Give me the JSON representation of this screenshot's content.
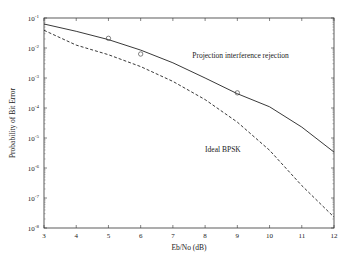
{
  "chart_data": {
    "type": "line",
    "title": "",
    "xlabel": "Eb/No (dB)",
    "ylabel": "Probability of Bit Error",
    "xlim": [
      3,
      12
    ],
    "ylim": [
      1e-08,
      0.1
    ],
    "yscale": "log",
    "grid": false,
    "x_ticks": [
      "3",
      "4",
      "5",
      "6",
      "7",
      "8",
      "9",
      "10",
      "11",
      "12"
    ],
    "y_ticks": [
      {
        "base": "10",
        "exp": "-1"
      },
      {
        "base": "10",
        "exp": "-2"
      },
      {
        "base": "10",
        "exp": "-3"
      },
      {
        "base": "10",
        "exp": "-4"
      },
      {
        "base": "10",
        "exp": "-5"
      },
      {
        "base": "10",
        "exp": "-6"
      },
      {
        "base": "10",
        "exp": "-7"
      },
      {
        "base": "10",
        "exp": "-8"
      }
    ],
    "x": [
      3,
      4,
      5,
      6,
      7,
      8,
      9,
      10,
      11,
      12
    ],
    "series": [
      {
        "name": "Projection interference rejection",
        "style": "solid",
        "values": [
          0.063,
          0.036,
          0.019,
          0.0085,
          0.0032,
          0.001,
          0.0003,
          0.00011,
          2.3e-05,
          3.4e-06
        ]
      },
      {
        "name": "Ideal BPSK",
        "style": "dashed",
        "values": [
          0.039,
          0.0125,
          0.006,
          0.0024,
          0.00077,
          0.00019,
          3.4e-05,
          3.9e-06,
          2.6e-07,
          2.3e-08
        ]
      }
    ],
    "markers": {
      "style": "circle",
      "points": [
        {
          "x": 5,
          "y": 0.021
        },
        {
          "x": 6,
          "y": 0.0063
        },
        {
          "x": 9,
          "y": 0.00032
        }
      ]
    },
    "annotations": [
      {
        "text": "Projection interference rejection",
        "x": 7.6,
        "y": 0.0045
      },
      {
        "text": "Ideal BPSK",
        "x": 8.0,
        "y": 3.5e-06
      }
    ]
  }
}
